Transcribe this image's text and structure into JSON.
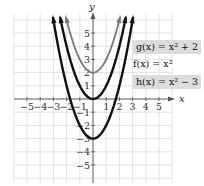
{
  "chart_data": {
    "type": "line",
    "title": "",
    "xlabel": "x",
    "ylabel": "y",
    "xlim": [
      -6,
      6
    ],
    "ylim": [
      -6.4,
      6.4
    ],
    "grid": true,
    "xticks": [
      -5,
      -4,
      -3,
      -2,
      -1,
      1,
      2,
      3,
      4,
      5
    ],
    "yticks": [
      -5,
      -4,
      -3,
      -2,
      -1,
      1,
      2,
      3,
      4,
      5
    ],
    "series": [
      {
        "name": "g(x) = x² + 2",
        "formula": "x^2 + 2",
        "color": "#777777",
        "vertex": [
          0,
          2
        ],
        "x": [
          -2,
          -1,
          0,
          1,
          2
        ],
        "values": [
          6,
          3,
          2,
          3,
          6
        ]
      },
      {
        "name": "f(x) = x²",
        "formula": "x^2",
        "color": "#111111",
        "vertex": [
          0,
          0
        ],
        "x": [
          -2,
          -1,
          0,
          1,
          2
        ],
        "values": [
          4,
          1,
          0,
          1,
          4
        ]
      },
      {
        "name": "h(x) = x² − 3",
        "formula": "x^2 - 3",
        "color": "#111111",
        "vertex": [
          0,
          -3
        ],
        "x": [
          -3,
          -2,
          -1,
          0,
          1,
          2,
          3
        ],
        "values": [
          6,
          1,
          -2,
          -3,
          -2,
          1,
          6
        ]
      }
    ],
    "legend_position": "right"
  },
  "axes": {
    "x_label": "x",
    "y_label": "y",
    "x_tick_labels": [
      "−5",
      "−4",
      "−3",
      "−2",
      "−1",
      "1",
      "2",
      "3",
      "4",
      "5"
    ],
    "y_tick_labels_pos": [
      "1",
      "2",
      "3",
      "4",
      "5"
    ],
    "y_tick_labels_neg": [
      "−1",
      "−2",
      "−3",
      "−4",
      "−5"
    ]
  },
  "legend": {
    "g": "g(x) = x² + 2",
    "f": "f(x) = x²",
    "h": "h(x) = x² − 3"
  }
}
